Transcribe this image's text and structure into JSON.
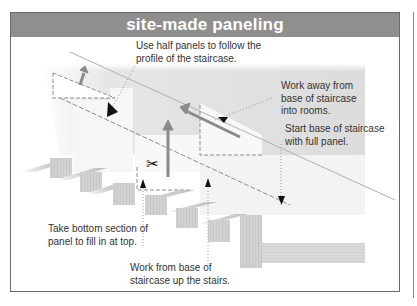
{
  "title": "site-made paneling",
  "callouts": {
    "half_panels": [
      "Use half panels to follow the",
      "profile of the staircase."
    ],
    "work_away": [
      "Work away from",
      "base of staircase",
      "into rooms."
    ],
    "start_base": [
      "Start base of staircase",
      "with full panel."
    ],
    "take_bottom": [
      "Take bottom section of",
      "panel to fill in at top."
    ],
    "work_from_base": [
      "Work from base of",
      "staircase up the stairs."
    ]
  },
  "icons": {
    "scissors": "✂"
  },
  "colors": {
    "title_bar": "#8f8f8f",
    "wall": "#e2e2e2",
    "arrow": "#888888",
    "frame": "#6a6a6a"
  }
}
